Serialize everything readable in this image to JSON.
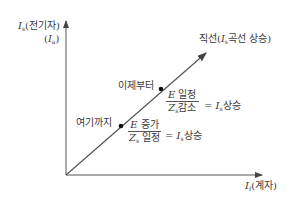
{
  "diagram": {
    "y_axis": {
      "var": "I",
      "sub": "s",
      "label": "(전기자)",
      "alt_var": "I",
      "alt_sub": "a"
    },
    "x_axis": {
      "var": "I",
      "sub": "f",
      "label": "(계자)"
    },
    "line_label": {
      "prefix": "직선(",
      "var": "I",
      "sub": "s",
      "suffix": "곡선 상승)"
    },
    "point_upper": {
      "label": "이제부터",
      "num_var": "E",
      "num_text": " 일정",
      "den_var": "Z",
      "den_sub": "s",
      "den_text": "감소",
      "eq": "=",
      "res_var": "I",
      "res_sub": "s",
      "res_text": "상승"
    },
    "point_lower": {
      "label": "여기까지",
      "num_var": "E",
      "num_text": " 증가",
      "den_var": "Z",
      "den_sub": "s",
      "den_text": " 일정",
      "eq": "=",
      "res_var": "I",
      "res_sub": "s",
      "res_text": "상승"
    },
    "colors": {
      "line": "#555555",
      "dot": "#111111"
    }
  }
}
